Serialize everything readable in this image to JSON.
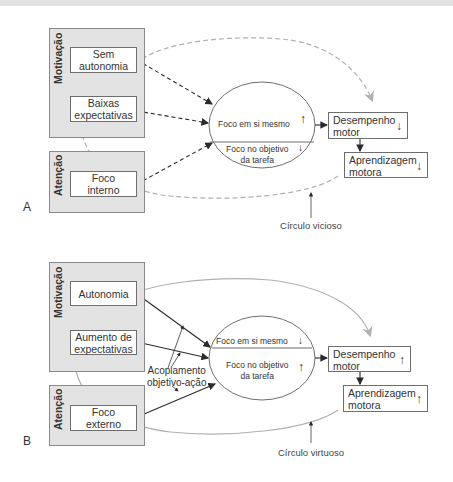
{
  "panels": {
    "A": {
      "letter": "A",
      "motivation_group": {
        "label": "Motivação",
        "nodes": [
          "Sem autonomia",
          "Baixas expectativas"
        ],
        "node_lines": [
          [
            "Sem",
            "autonomia"
          ],
          [
            "Baixas",
            "expectativas"
          ]
        ]
      },
      "attention_group": {
        "label": "Atenção",
        "node_lines": [
          "Foco",
          "interno"
        ]
      },
      "ellipse": {
        "top": "Foco em si mesmo",
        "top_arrow": "↑",
        "bottom_lines": [
          "Foco no objetivo",
          "da tarefa"
        ],
        "bottom_arrow": "↓"
      },
      "outcomes": [
        {
          "lines": [
            "Desempenho",
            "motor"
          ],
          "arrow": "↓"
        },
        {
          "lines": [
            "Aprendizagem",
            "motora"
          ],
          "arrow": "↓"
        }
      ],
      "loop_caption": "Círculo vicioso",
      "loop_style": "dashed"
    },
    "B": {
      "letter": "B",
      "motivation_group": {
        "label": "Motivação",
        "node_lines": [
          [
            "Autonomia"
          ],
          [
            "Aumento de",
            "expectativas"
          ]
        ]
      },
      "attention_group": {
        "label": "Atenção",
        "node_lines": [
          "Foco",
          "externo"
        ]
      },
      "ellipse": {
        "top": "Foco em si mesmo",
        "top_arrow": "↓",
        "bottom_lines": [
          "Foco no objetivo",
          "da tarefa"
        ],
        "bottom_arrow": "↑"
      },
      "outcomes": [
        {
          "lines": [
            "Desempenho",
            "motor"
          ],
          "arrow": "↑"
        },
        {
          "lines": [
            "Aprendizagem",
            "motora"
          ],
          "arrow": "↑"
        }
      ],
      "coupling_label_lines": [
        "Acoplamento",
        "objetivo-ação"
      ],
      "loop_caption": "Círculo virtuoso",
      "loop_style": "solid"
    }
  },
  "colors": {
    "group_fill": "#e3e3e3",
    "loop_gray": "#a8a8a8",
    "arrow_dark": "#2a2a2a"
  }
}
